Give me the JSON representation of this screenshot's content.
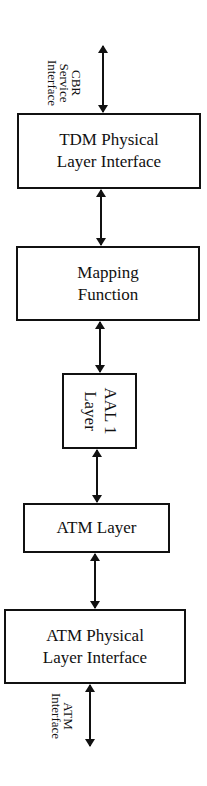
{
  "diagram": {
    "type": "layered-stack",
    "top_interface": {
      "label": "CBR\nService\nInterface"
    },
    "boxes": [
      {
        "id": "tdm-physical",
        "label": "TDM Physical\nLayer Interface"
      },
      {
        "id": "mapping",
        "label": "Mapping\nFunction"
      },
      {
        "id": "aal1",
        "label": "AAL 1\nLayer",
        "orientation": "rotated-90"
      },
      {
        "id": "atm-layer",
        "label": "ATM Layer"
      },
      {
        "id": "atm-physical",
        "label": "ATM Physical\nLayer Interface"
      }
    ],
    "bottom_interface": {
      "label": "ATM\nInterface"
    },
    "connectors": [
      {
        "from": "CBR Service Interface",
        "to": "TDM Physical Layer Interface",
        "type": "bidirectional"
      },
      {
        "from": "TDM Physical Layer Interface",
        "to": "Mapping Function",
        "type": "bidirectional"
      },
      {
        "from": "Mapping Function",
        "to": "AAL 1 Layer",
        "type": "bidirectional"
      },
      {
        "from": "AAL 1 Layer",
        "to": "ATM Layer",
        "type": "bidirectional"
      },
      {
        "from": "ATM Layer",
        "to": "ATM Physical Layer Interface",
        "type": "bidirectional"
      },
      {
        "from": "ATM Physical Layer Interface",
        "to": "ATM Interface",
        "type": "bidirectional"
      }
    ],
    "colors": {
      "stroke": "#111111",
      "background": "#ffffff"
    }
  }
}
